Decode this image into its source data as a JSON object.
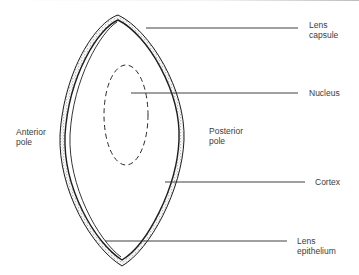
{
  "figure": {
    "type": "anatomical-diagram",
    "colors": {
      "line": "#1e1e1e",
      "stipple": "#8a8a8a",
      "text": "#3c3c3c",
      "background": "#ffffff"
    }
  },
  "labels": {
    "lens_capsule": "Lens\ncapsule",
    "nucleus": "Nucleus",
    "anterior_pole": "Anterior\npole",
    "posterior_pole": "Posterior\npole",
    "cortex": "Cortex",
    "lens_epithelium": "Lens\nepithelium"
  }
}
